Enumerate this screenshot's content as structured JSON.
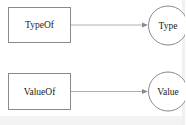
{
  "diagram": {
    "rows": [
      {
        "source": {
          "label": "TypeOf",
          "shape": "rectangle"
        },
        "target": {
          "label": "Type",
          "shape": "circle"
        }
      },
      {
        "source": {
          "label": "ValueOf",
          "shape": "rectangle"
        },
        "target": {
          "label": "Value",
          "shape": "circle"
        }
      }
    ],
    "colors": {
      "stroke": "#8a8a8a",
      "edge": "#9a9a9a",
      "text": "#222222",
      "background": "#ffffff"
    }
  }
}
